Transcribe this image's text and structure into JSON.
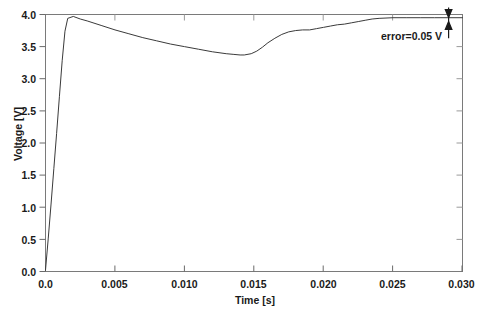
{
  "chart_data": {
    "type": "line",
    "title": "",
    "xlabel": "Time [s]",
    "ylabel": "Voltage [V]",
    "xlim": [
      0.0,
      0.03
    ],
    "ylim": [
      0.0,
      4.0
    ],
    "xticks": [
      0.0,
      0.005,
      0.01,
      0.015,
      0.02,
      0.025,
      0.03
    ],
    "xticklabels": [
      "0.0",
      "0.005",
      "0.010",
      "0.015",
      "0.020",
      "0.025",
      "0.030"
    ],
    "yticks": [
      0.0,
      0.5,
      1.0,
      1.5,
      2.0,
      2.5,
      3.0,
      3.5,
      4.0
    ],
    "yticklabels": [
      "0.0",
      "0.5",
      "1.0",
      "1.5",
      "2.0",
      "2.5",
      "3.0",
      "3.5",
      "4.0"
    ],
    "grid": false,
    "legend": null,
    "line_color": "#3a3a3a",
    "series": [
      {
        "name": "Voltage",
        "x": [
          0.0,
          0.0002,
          0.0004,
          0.0006,
          0.0008,
          0.001,
          0.0012,
          0.0014,
          0.0016,
          0.002,
          0.0025,
          0.003,
          0.004,
          0.005,
          0.006,
          0.007,
          0.008,
          0.009,
          0.01,
          0.011,
          0.012,
          0.013,
          0.0135,
          0.014,
          0.0143,
          0.0148,
          0.0152,
          0.0156,
          0.016,
          0.0165,
          0.017,
          0.0175,
          0.018,
          0.0185,
          0.019,
          0.0195,
          0.02,
          0.0205,
          0.021,
          0.0215,
          0.022,
          0.0225,
          0.023,
          0.0235,
          0.024,
          0.025,
          0.026,
          0.027,
          0.028,
          0.029,
          0.03
        ],
        "y": [
          0.02,
          0.52,
          1.05,
          1.6,
          2.15,
          2.72,
          3.28,
          3.74,
          3.94,
          3.97,
          3.93,
          3.9,
          3.83,
          3.76,
          3.7,
          3.64,
          3.59,
          3.54,
          3.5,
          3.46,
          3.42,
          3.39,
          3.38,
          3.37,
          3.37,
          3.39,
          3.43,
          3.49,
          3.56,
          3.63,
          3.69,
          3.73,
          3.75,
          3.76,
          3.76,
          3.78,
          3.8,
          3.82,
          3.84,
          3.85,
          3.87,
          3.89,
          3.91,
          3.93,
          3.94,
          3.95,
          3.95,
          3.95,
          3.95,
          3.95,
          3.95
        ]
      }
    ],
    "annotations": [
      {
        "name": "error-annotation",
        "text": "error=0.05 V",
        "arrow": "double-headed-vertical",
        "x": 0.029,
        "y_top": 4.0,
        "y_bottom": 3.63
      }
    ]
  }
}
